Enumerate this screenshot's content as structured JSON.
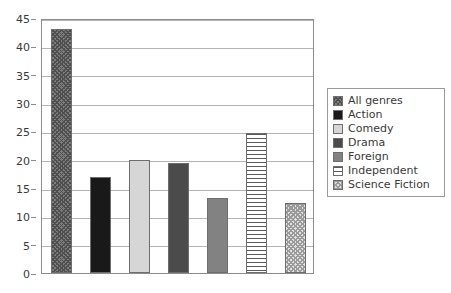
{
  "chart_data": {
    "type": "bar",
    "title": "",
    "subtitle": "",
    "xlabel": "",
    "ylabel": "",
    "categories": [
      "All genres",
      "Action",
      "Comedy",
      "Drama",
      "Foreign",
      "Independent",
      "Science Fiction"
    ],
    "values": [
      43,
      17,
      20,
      19.4,
      13.3,
      24.7,
      12.4
    ],
    "ylim": [
      0,
      45
    ],
    "ytick_labels": [
      "0",
      "5",
      "10",
      "15",
      "20",
      "25",
      "30",
      "35",
      "40",
      "45"
    ],
    "ytick_values": [
      0,
      5,
      10,
      15,
      20,
      25,
      30,
      35,
      40,
      45
    ],
    "xtick_labels": [],
    "grid": "horizontal",
    "legend_position": "right",
    "series": [
      {
        "name": "All genres",
        "value": 43,
        "pattern": "crosshatch-dark",
        "color": "#7d7d7d"
      },
      {
        "name": "Action",
        "value": 17,
        "pattern": "solid",
        "color": "#191919"
      },
      {
        "name": "Comedy",
        "value": 20,
        "pattern": "solid",
        "color": "#d6d6d6"
      },
      {
        "name": "Drama",
        "value": 19.4,
        "pattern": "solid",
        "color": "#4b4b4b"
      },
      {
        "name": "Foreign",
        "value": 13.3,
        "pattern": "solid",
        "color": "#828282"
      },
      {
        "name": "Independent",
        "value": 24.7,
        "pattern": "horizontal-lines",
        "color": "#5a5a5a"
      },
      {
        "name": "Science Fiction",
        "value": 12.4,
        "pattern": "checker-light",
        "color": "#9a9a9a"
      }
    ]
  },
  "legend": {
    "items": [
      {
        "label": "All genres"
      },
      {
        "label": "Action"
      },
      {
        "label": "Comedy"
      },
      {
        "label": "Drama"
      },
      {
        "label": "Foreign"
      },
      {
        "label": "Independent"
      },
      {
        "label": "Science Fiction"
      }
    ]
  },
  "axes": {
    "y_ticks": [
      {
        "label": "45"
      },
      {
        "label": "40"
      },
      {
        "label": "35"
      },
      {
        "label": "30"
      },
      {
        "label": "25"
      },
      {
        "label": "20"
      },
      {
        "label": "15"
      },
      {
        "label": "10"
      },
      {
        "label": "5"
      },
      {
        "label": "0"
      }
    ]
  },
  "style": {
    "plot_border_color": "#8c8c8c",
    "gridline_color": "#b4b4b4",
    "bar_border_color": "#6e6e6e",
    "text_color": "#3a3a3a",
    "background": "#ffffff"
  }
}
